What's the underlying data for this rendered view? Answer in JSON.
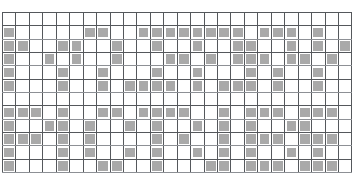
{
  "app": {
    "title": "Pattern Grid",
    "type": "pixel-pattern-chart"
  },
  "grid": {
    "columns": 26,
    "rows": 12,
    "cell_size_px": 13.4,
    "origin_x_px": 2,
    "origin_y_px": 12,
    "colors": {
      "background": "#ffffff",
      "gridline": "#55585c",
      "gridline_light": "#8d9095",
      "filled_cell": "#a9a9a9"
    },
    "legend": {
      "filled_label": "filled",
      "empty_label": "empty"
    },
    "light_rows": [
      1,
      3,
      5,
      7,
      9,
      11
    ],
    "cells": [
      [
        0,
        0,
        0,
        0,
        0,
        0,
        0,
        0,
        0,
        0,
        0,
        0,
        0,
        0,
        0,
        0,
        0,
        0,
        0,
        0,
        0,
        0,
        0,
        0,
        0,
        0
      ],
      [
        1,
        0,
        0,
        0,
        0,
        0,
        1,
        1,
        0,
        0,
        1,
        1,
        1,
        1,
        1,
        1,
        1,
        1,
        0,
        1,
        1,
        1,
        0,
        1,
        0,
        0
      ],
      [
        1,
        1,
        0,
        0,
        1,
        1,
        0,
        0,
        1,
        0,
        0,
        1,
        0,
        0,
        1,
        0,
        0,
        1,
        1,
        0,
        0,
        1,
        0,
        1,
        0,
        1
      ],
      [
        1,
        0,
        0,
        1,
        0,
        1,
        0,
        0,
        1,
        0,
        0,
        0,
        1,
        1,
        0,
        1,
        0,
        1,
        1,
        1,
        0,
        1,
        1,
        0,
        1,
        0
      ],
      [
        1,
        0,
        0,
        0,
        1,
        0,
        0,
        1,
        0,
        0,
        0,
        1,
        0,
        0,
        1,
        0,
        0,
        0,
        1,
        0,
        1,
        0,
        0,
        1,
        0,
        0
      ],
      [
        1,
        0,
        0,
        0,
        1,
        0,
        0,
        1,
        0,
        1,
        1,
        1,
        1,
        0,
        1,
        0,
        1,
        1,
        1,
        0,
        1,
        0,
        0,
        1,
        0,
        0
      ],
      [
        0,
        0,
        0,
        0,
        0,
        0,
        0,
        0,
        0,
        0,
        0,
        0,
        0,
        0,
        0,
        0,
        0,
        0,
        0,
        0,
        0,
        0,
        0,
        0,
        0,
        0
      ],
      [
        1,
        1,
        1,
        0,
        1,
        0,
        0,
        1,
        1,
        0,
        1,
        1,
        1,
        1,
        0,
        0,
        1,
        0,
        1,
        1,
        1,
        0,
        1,
        1,
        1,
        0
      ],
      [
        1,
        0,
        0,
        1,
        1,
        0,
        1,
        0,
        0,
        1,
        0,
        1,
        0,
        0,
        1,
        0,
        1,
        0,
        1,
        0,
        0,
        1,
        1,
        0,
        0,
        0
      ],
      [
        1,
        1,
        1,
        0,
        1,
        0,
        1,
        0,
        0,
        0,
        0,
        1,
        0,
        1,
        0,
        0,
        1,
        0,
        1,
        1,
        1,
        0,
        1,
        1,
        1,
        0
      ],
      [
        1,
        0,
        0,
        0,
        1,
        0,
        1,
        0,
        0,
        1,
        0,
        1,
        0,
        0,
        1,
        0,
        1,
        0,
        1,
        0,
        0,
        1,
        0,
        1,
        0,
        0
      ],
      [
        1,
        0,
        0,
        0,
        1,
        0,
        0,
        1,
        1,
        0,
        0,
        1,
        0,
        0,
        0,
        1,
        1,
        0,
        1,
        1,
        1,
        0,
        1,
        1,
        1,
        0
      ]
    ]
  }
}
